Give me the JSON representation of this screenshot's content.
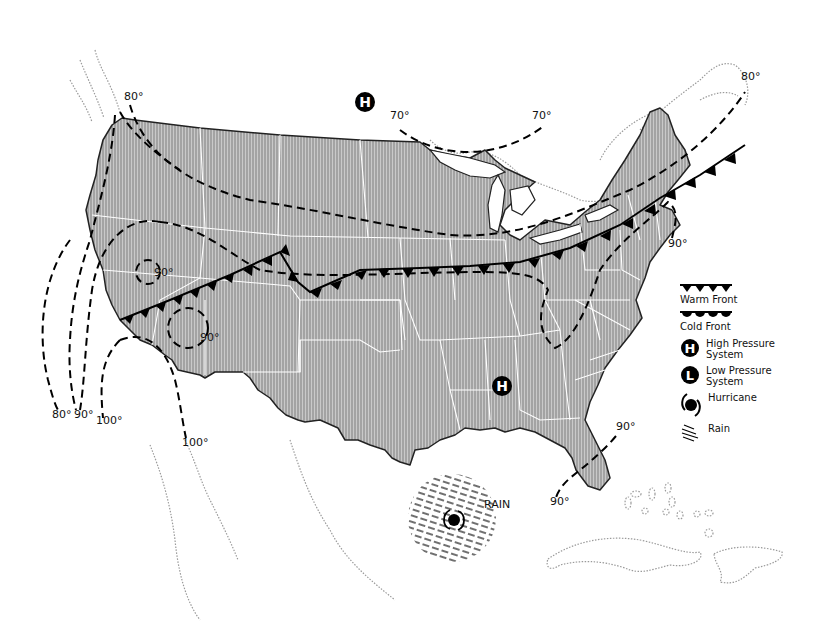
{
  "map": {
    "title": "U.S. Weather Map",
    "colors": {
      "land_fill": "#bdbdbd",
      "land_hatch": "#8a8a8a",
      "state_border": "#ffffff",
      "outline": "#222222",
      "foreign_coast": "#9a9a9a",
      "front": "#000000",
      "isotherm": "#000000",
      "background": "#ffffff"
    },
    "isotherm_labels": [
      {
        "id": "nw-80",
        "text": "80°",
        "x": 124,
        "y": 100
      },
      {
        "id": "sw-80",
        "text": "80°",
        "x": 52,
        "y": 416
      },
      {
        "id": "sw-90",
        "text": "90°",
        "x": 75,
        "y": 416
      },
      {
        "id": "sw-100a",
        "text": "100°",
        "x": 97,
        "y": 423
      },
      {
        "id": "sw-100b",
        "text": "100°",
        "x": 182,
        "y": 445
      },
      {
        "id": "nv-90",
        "text": "90°",
        "x": 154,
        "y": 272
      },
      {
        "id": "az-90",
        "text": "90°",
        "x": 203,
        "y": 341
      },
      {
        "id": "n-70a",
        "text": "70°",
        "x": 390,
        "y": 118
      },
      {
        "id": "n-70b",
        "text": "70°",
        "x": 534,
        "y": 118
      },
      {
        "id": "ne-80",
        "text": "80°",
        "x": 741,
        "y": 80
      },
      {
        "id": "ne-90",
        "text": "90°",
        "x": 670,
        "y": 246
      },
      {
        "id": "fl-90a",
        "text": "90°",
        "x": 618,
        "y": 429
      },
      {
        "id": "fl-90b",
        "text": "90°",
        "x": 553,
        "y": 504
      }
    ],
    "rain_label": "RAIN",
    "symbols": {
      "high_north": {
        "letter": "H",
        "x": 365,
        "y": 102
      },
      "high_south": {
        "letter": "H",
        "x": 502,
        "y": 386
      },
      "hurricane": {
        "x": 454,
        "y": 520
      }
    }
  },
  "legend": {
    "items": [
      {
        "id": "warm-front",
        "label": "Warm Front",
        "icon": "warm-front-icon"
      },
      {
        "id": "cold-front",
        "label": "Cold Front",
        "icon": "cold-front-icon"
      },
      {
        "id": "high-pressure",
        "label_line1": "High Pressure",
        "label_line2": "System",
        "icon": "high-pressure-icon",
        "letter": "H"
      },
      {
        "id": "low-pressure",
        "label_line1": "Low Pressure",
        "label_line2": "System",
        "icon": "low-pressure-icon",
        "letter": "L"
      },
      {
        "id": "hurricane",
        "label": "Hurricane",
        "icon": "hurricane-icon"
      },
      {
        "id": "rain",
        "label": "Rain",
        "icon": "rain-icon"
      }
    ]
  }
}
